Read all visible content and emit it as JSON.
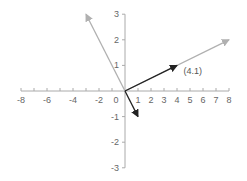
{
  "chart_data": {
    "type": "vector-plot",
    "title": "",
    "xlabel": "",
    "ylabel": "",
    "xlim": [
      -8,
      8
    ],
    "ylim": [
      -3,
      3
    ],
    "grid": false,
    "x_ticks": [
      -8,
      -6,
      -4,
      -2,
      1,
      2,
      3,
      4,
      5,
      6,
      7,
      8
    ],
    "y_ticks": [
      3,
      2,
      1,
      -1,
      -2,
      -3
    ],
    "origin_label": "0",
    "vectors": [
      {
        "name": "v-gray-long",
        "from": [
          0,
          0
        ],
        "to": [
          8,
          2
        ],
        "color": "#b0b0b0"
      },
      {
        "name": "v-gray-upleft",
        "from": [
          0,
          0
        ],
        "to": [
          -3,
          3
        ],
        "color": "#b0b0b0"
      },
      {
        "name": "v-black-41",
        "from": [
          0,
          0
        ],
        "to": [
          4,
          1
        ],
        "color": "#222222"
      },
      {
        "name": "v-black-down",
        "from": [
          0,
          0
        ],
        "to": [
          1,
          -1
        ],
        "color": "#222222"
      }
    ],
    "annotations": [
      {
        "text": "(4.1)",
        "at": [
          4.5,
          0.65
        ]
      }
    ]
  },
  "colors": {
    "axis": "#aaaaaa",
    "tick_label": "#666666"
  }
}
